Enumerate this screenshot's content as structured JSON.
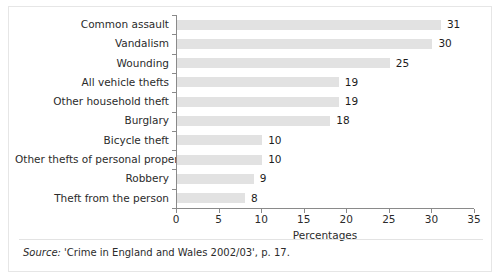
{
  "chart_data": {
    "type": "bar",
    "orientation": "horizontal",
    "title": "",
    "xlabel": "Percentages",
    "ylabel": "",
    "categories": [
      "Common assault",
      "Vandalism",
      "Wounding",
      "All vehicle thefts",
      "Other household theft",
      "Burglary",
      "Bicycle theft",
      "Other thefts of personal property",
      "Robbery",
      "Theft from the person"
    ],
    "values": [
      31,
      30,
      25,
      19,
      19,
      18,
      10,
      10,
      9,
      8
    ],
    "value_labels": [
      "31",
      "30",
      "25",
      "19",
      "19",
      "18",
      "10",
      "10",
      "9",
      "8"
    ],
    "xlim": [
      0,
      35
    ],
    "xticks": [
      0,
      5,
      10,
      15,
      20,
      25,
      30,
      35
    ],
    "xtick_labels": [
      "0",
      "5",
      "10",
      "15",
      "20",
      "25",
      "30",
      "35"
    ],
    "grid": false,
    "legend": false,
    "bar_color": "#e2e2e2",
    "axis_color": "#8a8a8a"
  },
  "footer": {
    "source_word": "Source:",
    "source_text": " 'Crime in England and Wales 2002/03', p. 17."
  }
}
